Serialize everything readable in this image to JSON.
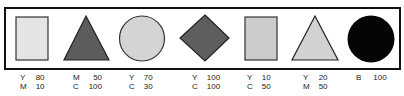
{
  "colors": {
    "frame": "#111111",
    "outline": "#333333",
    "very_light_gray": "#e4e4e4",
    "dark_gray": "#5c5c5c",
    "light_gray": "#d4d4d4",
    "mid_gray": "#5e5e5e",
    "pale_gray": "#cccccc",
    "pale_gray_2": "#d2d2d2",
    "black": "#050505"
  },
  "swatches": [
    {
      "shape": "rectangle",
      "fill": "#e4e4e4",
      "components": [
        {
          "ink": "Y",
          "value": "80"
        },
        {
          "ink": "M",
          "value": "10"
        }
      ]
    },
    {
      "shape": "triangle",
      "fill": "#5c5c5c",
      "components": [
        {
          "ink": "M",
          "value": "50"
        },
        {
          "ink": "C",
          "value": "100"
        }
      ]
    },
    {
      "shape": "circle",
      "fill": "#d4d4d4",
      "components": [
        {
          "ink": "Y",
          "value": "70"
        },
        {
          "ink": "C",
          "value": "30"
        }
      ]
    },
    {
      "shape": "diamond",
      "fill": "#5e5e5e",
      "components": [
        {
          "ink": "Y",
          "value": "100"
        },
        {
          "ink": "C",
          "value": "100"
        }
      ]
    },
    {
      "shape": "rectangle",
      "fill": "#cccccc",
      "components": [
        {
          "ink": "Y",
          "value": "10"
        },
        {
          "ink": "C",
          "value": "50"
        }
      ]
    },
    {
      "shape": "triangle",
      "fill": "#d2d2d2",
      "components": [
        {
          "ink": "Y",
          "value": "20"
        },
        {
          "ink": "M",
          "value": "50"
        }
      ]
    },
    {
      "shape": "circle",
      "fill": "#050505",
      "components": [
        {
          "ink": "B",
          "value": "100"
        }
      ]
    }
  ]
}
